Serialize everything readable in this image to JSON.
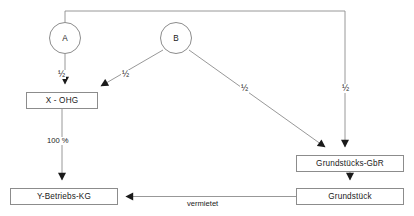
{
  "diagram": {
    "background_color": "#ffffff",
    "line_color": "#8c8c8c",
    "text_color": "#1a1a1a",
    "nodes": [
      {
        "id": "a",
        "label": "A",
        "shape": "circle",
        "x": 65,
        "y": 38,
        "w": 32,
        "h": 32
      },
      {
        "id": "b",
        "label": "B",
        "shape": "circle",
        "x": 176,
        "y": 38,
        "w": 32,
        "h": 32
      },
      {
        "id": "x_ohg",
        "label": "X - OHG",
        "shape": "rect",
        "x": 26,
        "y": 92,
        "w": 72,
        "h": 17
      },
      {
        "id": "grundst_gbr",
        "label": "Grundstücks-GbR",
        "shape": "rect",
        "x": 296,
        "y": 155,
        "w": 108,
        "h": 17
      },
      {
        "id": "y_kg",
        "label": "Y-Betriebs-KG",
        "shape": "rect",
        "x": 10,
        "y": 188,
        "w": 108,
        "h": 17
      },
      {
        "id": "grundstueck",
        "label": "Grundstück",
        "shape": "rect",
        "x": 296,
        "y": 188,
        "w": 108,
        "h": 17
      }
    ],
    "edges": [
      {
        "id": "a-to-xohg",
        "from": "A",
        "to": "X - OHG",
        "label": "½"
      },
      {
        "id": "b-to-xohg",
        "from": "B",
        "to": "X - OHG",
        "label": "½"
      },
      {
        "id": "b-to-gbr",
        "from": "B",
        "to": "Grundstücks-GbR",
        "label": "½"
      },
      {
        "id": "a-to-gbr",
        "from": "A",
        "to": "Grundstücks-GbR",
        "label": "½"
      },
      {
        "id": "xohg-to-ykg",
        "from": "X - OHG",
        "to": "Y-Betriebs-KG",
        "label": "100 %"
      },
      {
        "id": "gbr-to-grundstueck",
        "from": "Grundstücks-GbR",
        "to": "Grundstück",
        "label": ""
      },
      {
        "id": "grundstueck-to-ykg",
        "from": "Grundstück",
        "to": "Y-Betriebs-KG",
        "label": "vermietet"
      }
    ],
    "labels": {
      "a_to_xohg": "½",
      "b_to_xohg": "½",
      "b_to_gbr": "½",
      "a_to_gbr": "½",
      "xohg_to_ykg": "100 %",
      "grundstueck_to_ykg": "vermietet"
    }
  }
}
